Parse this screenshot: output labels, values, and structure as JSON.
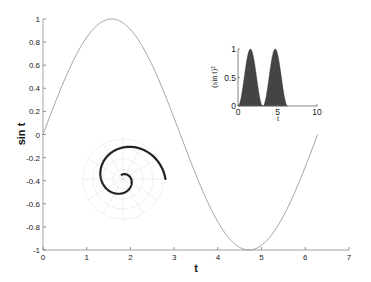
{
  "chart_data": [
    {
      "id": "main",
      "type": "line",
      "title": "",
      "xlabel": "t",
      "ylabel": "sin t",
      "xlim": [
        0,
        7
      ],
      "ylim": [
        -1,
        1
      ],
      "xticks": [
        0,
        1,
        2,
        3,
        4,
        5,
        6,
        7
      ],
      "xtick_labels": [
        "0",
        "1",
        "2",
        "3",
        "4",
        "5",
        "6",
        "7"
      ],
      "yticks": [
        -1,
        -0.8,
        -0.6,
        -0.4,
        -0.2,
        0,
        0.2,
        0.4,
        0.6,
        0.8,
        1
      ],
      "ytick_labels": [
        "-1",
        "-0.8",
        "-0.6",
        "-0.4",
        "-0.2",
        "0",
        "0.2",
        "0.4",
        "0.6",
        "0.8",
        "1"
      ],
      "grid": false,
      "series": [
        {
          "name": "sin t",
          "function": "sin(t)",
          "t_range": [
            0,
            6.2832
          ],
          "color": "#9a9a9a",
          "x": [
            0,
            0.785,
            1.571,
            2.356,
            3.142,
            3.927,
            4.712,
            5.498,
            6.283
          ],
          "values": [
            0,
            0.707,
            1,
            0.707,
            0,
            -0.707,
            -1,
            -0.707,
            0
          ]
        }
      ]
    },
    {
      "id": "inset-area",
      "type": "area",
      "xlabel": "t",
      "ylabel": "(sin t)²",
      "xlim": [
        0,
        10
      ],
      "ylim": [
        0,
        1
      ],
      "xticks": [
        0,
        5,
        10
      ],
      "xtick_labels": [
        "0",
        "5",
        "10"
      ],
      "yticks": [
        0,
        0.5,
        1
      ],
      "ytick_labels": [
        "0",
        "0.5",
        "1"
      ],
      "series": [
        {
          "name": "(sin t)^2",
          "function": "sin(t)^2",
          "t_range": [
            0,
            6.2832
          ],
          "color": "#444444",
          "x": [
            0,
            0.785,
            1.571,
            2.356,
            3.142,
            3.927,
            4.712,
            5.498,
            6.283
          ],
          "values": [
            0,
            0.5,
            1,
            0.5,
            0,
            0.5,
            1,
            0.5,
            0
          ]
        }
      ]
    },
    {
      "id": "inset-polar",
      "type": "polar-line",
      "rings": 4,
      "spokes_deg": 30,
      "series": [
        {
          "name": "spiral",
          "function": "r = t/(2*pi) (spiral)",
          "t_range": [
            0,
            6.2832
          ],
          "color": "#222222"
        }
      ]
    }
  ],
  "labels": {
    "xlabel": "t",
    "ylabel": "sin t",
    "inset_xlabel": "t",
    "inset_ylabel": "(sin t)²"
  }
}
